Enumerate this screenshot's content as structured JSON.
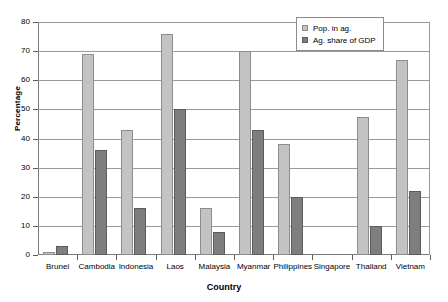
{
  "chart_data": {
    "type": "bar",
    "title": "",
    "xlabel": "Country",
    "ylabel": "Percentage",
    "ylim": [
      0,
      80
    ],
    "yticks": [
      0,
      10,
      20,
      30,
      40,
      50,
      60,
      70,
      80
    ],
    "grid": true,
    "legend_position": "top-right",
    "categories": [
      "Brunei",
      "Cambodia",
      "Indonesia",
      "Laos",
      "Malaysia",
      "Myanmar",
      "Philippines",
      "Singapore",
      "Thailand",
      "Vietnam"
    ],
    "series": [
      {
        "name": "Pop. in ag.",
        "color": "#c3c3c3",
        "values": [
          1,
          69,
          43,
          76,
          16,
          70,
          38,
          0,
          47.5,
          67
        ]
      },
      {
        "name": "Ag. share of GDP",
        "color": "#7e7e7e",
        "values": [
          3,
          36,
          16,
          50,
          8,
          43,
          20,
          0,
          10,
          22
        ]
      }
    ]
  },
  "legend": {
    "items": [
      {
        "label": "Pop. in ag."
      },
      {
        "label": "Ag. share of GDP"
      }
    ]
  }
}
